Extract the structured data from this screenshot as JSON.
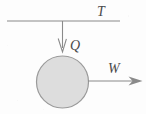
{
  "figure": {
    "background_color": "#fdfdfd",
    "stroke_color": "#8a8a8a",
    "body_fill_color": "#dddddd",
    "body_stroke_color": "#9a9a9a",
    "label_color": "#4a4a4a"
  },
  "labels": {
    "support_tension": "T",
    "downward_force": "Q",
    "rightward_force": "W"
  },
  "geometry": {
    "support_line": {
      "x1": 7,
      "y1": 21,
      "x2": 120,
      "y2": 21
    },
    "down_arrow": {
      "x": 62.5,
      "y_start": 21,
      "y_end": 52
    },
    "right_arrow": {
      "y": 81,
      "x_start": 88,
      "x_end": 142
    },
    "body_circle": {
      "cx": 62.5,
      "cy": 82,
      "r": 26
    }
  },
  "label_positions": {
    "support_tension": {
      "x": 97,
      "y": 16
    },
    "downward_force": {
      "x": 70,
      "y": 50
    },
    "rightward_force": {
      "x": 108,
      "y": 73
    }
  }
}
